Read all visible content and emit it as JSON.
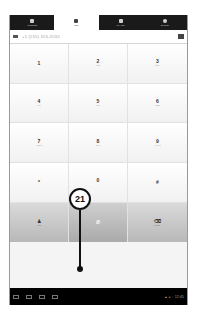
{
  "tabs": [
    {
      "label": "Contacts",
      "icon": "person-icon",
      "active": false
    },
    {
      "label": "Call",
      "icon": "keypad-icon",
      "active": true
    },
    {
      "label": "My Info",
      "icon": "contact-card-icon",
      "active": false
    },
    {
      "label": "Events",
      "icon": "clock-icon",
      "active": false
    }
  ],
  "number_field": {
    "value": "+1 (555) 555-5555",
    "blurred": true
  },
  "keypad": [
    {
      "digit": "1",
      "sub": ""
    },
    {
      "digit": "2",
      "sub": "ABC"
    },
    {
      "digit": "3",
      "sub": "DEF"
    },
    {
      "digit": "4",
      "sub": "GHI"
    },
    {
      "digit": "5",
      "sub": "JKL"
    },
    {
      "digit": "6",
      "sub": "MNO"
    },
    {
      "digit": "7",
      "sub": "PQRS"
    },
    {
      "digit": "8",
      "sub": "TUV"
    },
    {
      "digit": "9",
      "sub": "WXYZ"
    },
    {
      "digit": "*",
      "sub": ""
    },
    {
      "digit": "0",
      "sub": "+"
    },
    {
      "digit": "#",
      "sub": ""
    }
  ],
  "actions": [
    {
      "label": "Add",
      "icon": "add-contact-icon"
    },
    {
      "label": "",
      "icon": "phone-icon"
    },
    {
      "label": "Delete",
      "icon": "backspace-icon"
    }
  ],
  "system_bar": {
    "status_text": "▲ ● ↑ 12:45"
  },
  "callout": {
    "number": "21"
  }
}
